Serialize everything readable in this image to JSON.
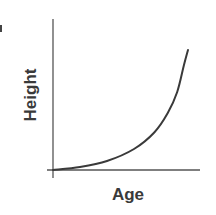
{
  "chart_data": {
    "type": "line",
    "title": "",
    "xlabel": "Age",
    "ylabel": "Height",
    "grid": false,
    "legend": null,
    "ticks": {
      "x": [],
      "y": []
    },
    "series": [
      {
        "name": "Height vs Age",
        "shape": "exponential-increase",
        "x": [
          0,
          0.2,
          0.4,
          0.6,
          0.75,
          0.85,
          0.92,
          0.97,
          1.0
        ],
        "y": [
          0,
          0.02,
          0.06,
          0.14,
          0.25,
          0.38,
          0.52,
          0.7,
          0.8
        ]
      }
    ],
    "xlim": [
      0,
      1
    ],
    "ylim": [
      0,
      1
    ]
  },
  "labels": {
    "x_axis": "Age",
    "y_axis": "Height"
  },
  "colors": {
    "axis": "#555555",
    "curve": "#3a3a3a",
    "text": "#3a3a3a",
    "background": "#ffffff"
  }
}
